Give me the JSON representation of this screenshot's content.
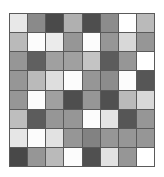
{
  "figure": {
    "title": "",
    "background_color": "#ffffff",
    "gridline_color": "#5a5a5a",
    "border_color": "#5a5a5a"
  },
  "chart_data": {
    "type": "heatmap",
    "title": "",
    "subtitle": "",
    "xlabel": "",
    "ylabel": "",
    "grid": true,
    "legend": "none",
    "rows": 8,
    "cols": 8,
    "colorscale": "grayscale",
    "value_range": [
      0,
      255
    ],
    "x_tick_labels": [
      "1",
      "2",
      "3",
      "4",
      "5",
      "6",
      "7",
      "8"
    ],
    "y_tick_labels": [
      "1",
      "2",
      "3",
      "4",
      "5",
      "6",
      "7",
      "8"
    ],
    "note": "Values are 8-bit gray levels read from each cell; 255 = white, 0 = black.",
    "values": [
      [
        232,
        138,
        74,
        176,
        78,
        140,
        255,
        186
      ],
      [
        186,
        252,
        235,
        150,
        252,
        150,
        216,
        150
      ],
      [
        150,
        96,
        160,
        160,
        196,
        92,
        150,
        255
      ],
      [
        150,
        186,
        222,
        252,
        150,
        140,
        252,
        86
      ],
      [
        150,
        252,
        160,
        78,
        150,
        80,
        186,
        216
      ],
      [
        190,
        92,
        150,
        150,
        252,
        228,
        86,
        150
      ],
      [
        230,
        252,
        226,
        150,
        130,
        150,
        150,
        150
      ],
      [
        72,
        150,
        186,
        252,
        80,
        226,
        150,
        255
      ]
    ],
    "hex_values": [
      [
        "#e8e8e8",
        "#8a8a8a",
        "#4a4a4a",
        "#b0b0b0",
        "#4e4e4e",
        "#8c8c8c",
        "#ffffff",
        "#bababa"
      ],
      [
        "#bababa",
        "#fcfcfc",
        "#ebebeb",
        "#969696",
        "#fcfcfc",
        "#969696",
        "#d8d8d8",
        "#969696"
      ],
      [
        "#969696",
        "#606060",
        "#a0a0a0",
        "#a0a0a0",
        "#c4c4c4",
        "#5c5c5c",
        "#969696",
        "#ffffff"
      ],
      [
        "#969696",
        "#bababa",
        "#dedede",
        "#fcfcfc",
        "#969696",
        "#8c8c8c",
        "#fcfcfc",
        "#565656"
      ],
      [
        "#969696",
        "#fcfcfc",
        "#a0a0a0",
        "#4e4e4e",
        "#969696",
        "#505050",
        "#bababa",
        "#d8d8d8"
      ],
      [
        "#bebebe",
        "#5c5c5c",
        "#969696",
        "#969696",
        "#fcfcfc",
        "#e4e4e4",
        "#565656",
        "#969696"
      ],
      [
        "#e6e6e6",
        "#fcfcfc",
        "#e2e2e2",
        "#969696",
        "#828282",
        "#969696",
        "#969696",
        "#969696"
      ],
      [
        "#484848",
        "#969696",
        "#bababa",
        "#fcfcfc",
        "#505050",
        "#e2e2e2",
        "#969696",
        "#ffffff"
      ]
    ]
  }
}
